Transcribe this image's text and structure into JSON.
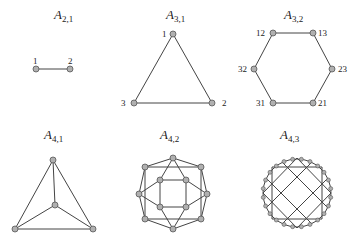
{
  "panels": [
    {
      "id": "A21",
      "title_main": "A",
      "title_sub": "2,1",
      "title_pos": [
        54,
        7
      ],
      "labels": [
        {
          "text": "1",
          "x": 33,
          "y": 56
        },
        {
          "text": "2",
          "x": 68,
          "y": 56
        }
      ]
    },
    {
      "id": "A31",
      "title_main": "A",
      "title_sub": "3,1",
      "title_pos": [
        166,
        7
      ],
      "labels": [
        {
          "text": "1",
          "x": 162,
          "y": 29
        },
        {
          "text": "2",
          "x": 222,
          "y": 98
        },
        {
          "text": "3",
          "x": 121,
          "y": 98
        }
      ]
    },
    {
      "id": "A32",
      "title_main": "A",
      "title_sub": "3,2",
      "title_pos": [
        284,
        7
      ],
      "labels": [
        {
          "text": "12",
          "x": 256,
          "y": 28
        },
        {
          "text": "13",
          "x": 318,
          "y": 28
        },
        {
          "text": "23",
          "x": 338,
          "y": 64
        },
        {
          "text": "21",
          "x": 318,
          "y": 98
        },
        {
          "text": "31",
          "x": 256,
          "y": 98
        },
        {
          "text": "32",
          "x": 238,
          "y": 64
        }
      ]
    },
    {
      "id": "A41",
      "title_main": "A",
      "title_sub": "4,1",
      "title_pos": [
        44,
        127
      ],
      "labels": []
    },
    {
      "id": "A42",
      "title_main": "A",
      "title_sub": "4,2",
      "title_pos": [
        160,
        127
      ],
      "labels": []
    },
    {
      "id": "A43",
      "title_main": "A",
      "title_sub": "4,3",
      "title_pos": [
        280,
        127
      ],
      "labels": []
    }
  ],
  "style": {
    "node_fill": "#b0b0b0",
    "node_stroke": "#555555",
    "edge_color": "#444444"
  }
}
